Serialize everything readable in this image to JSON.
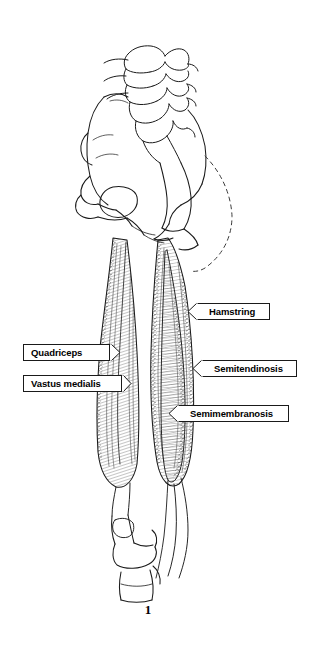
{
  "figure": {
    "number": "1",
    "background_color": "#ffffff",
    "ink_color": "#1a1a1a"
  },
  "labels": [
    {
      "id": "hamstring",
      "text": "Hamstring",
      "arrow_direction": "left",
      "x": 196,
      "y": 303,
      "width": 74,
      "tip_x": 187,
      "tip_y": 311
    },
    {
      "id": "quadriceps",
      "text": "Quadriceps",
      "arrow_direction": "right",
      "x": 23,
      "y": 344,
      "width": 87,
      "tip_x": 119,
      "tip_y": 352
    },
    {
      "id": "semitendinosis",
      "text": "Semitendinosis",
      "arrow_direction": "left",
      "x": 201,
      "y": 360,
      "width": 96,
      "tip_x": 192,
      "tip_y": 368
    },
    {
      "id": "vastus-medialis",
      "text": "Vastus medialis",
      "arrow_direction": "right",
      "x": 23,
      "y": 375,
      "width": 99,
      "tip_x": 131,
      "tip_y": 383
    },
    {
      "id": "semimembranosis",
      "text": "Semimembranosis",
      "arrow_direction": "left",
      "x": 177,
      "y": 405,
      "width": 112,
      "tip_x": 168,
      "tip_y": 413
    }
  ],
  "fig_number_position": {
    "x": 138,
    "y": 602,
    "width": 20
  }
}
